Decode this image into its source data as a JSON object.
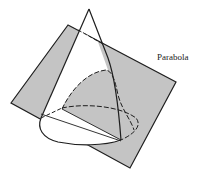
{
  "figure": {
    "label": "Parabola",
    "label_pos": {
      "x": 157,
      "y": 52
    },
    "colors": {
      "background": "#ffffff",
      "plane_fill": "#c4c4c4",
      "stroke": "#1e1e1e",
      "cone_interior": "#ffffff"
    },
    "geometry": {
      "apex": [
        89,
        9
      ],
      "plane_corners": [
        [
          68,
          25
        ],
        [
          11,
          103
        ],
        [
          130,
          168
        ],
        [
          176,
          82
        ]
      ],
      "base_ellipse": {
        "cx": 89,
        "cy": 126,
        "rx": 50,
        "ry": 18,
        "rotate": 8
      },
      "parabola_vertex": [
        108,
        70
      ]
    }
  }
}
